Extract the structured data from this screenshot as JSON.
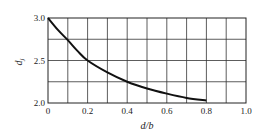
{
  "chart_data": {
    "type": "line",
    "title": "",
    "xlabel": "d/b",
    "ylabel": "d_j",
    "ylabel_main": "d",
    "ylabel_sub": "j",
    "xlim": [
      0,
      1.0
    ],
    "ylim": [
      2.0,
      3.0
    ],
    "grid": true,
    "x_grid_step": 0.1,
    "y_grid_step": 0.25,
    "x_ticks": [
      "0",
      "0.2",
      "0.4",
      "0.6",
      "0.8",
      "1.0"
    ],
    "y_ticks": [
      "2.0",
      "2.5",
      "3.0"
    ],
    "series": [
      {
        "name": "d_j",
        "x": [
          0,
          0.05,
          0.1,
          0.15,
          0.2,
          0.3,
          0.4,
          0.5,
          0.6,
          0.7,
          0.8
        ],
        "values": [
          3.0,
          2.86,
          2.74,
          2.61,
          2.5,
          2.36,
          2.25,
          2.17,
          2.11,
          2.06,
          2.03
        ]
      }
    ],
    "line_color": "#111111",
    "grid_color": "#333333"
  }
}
